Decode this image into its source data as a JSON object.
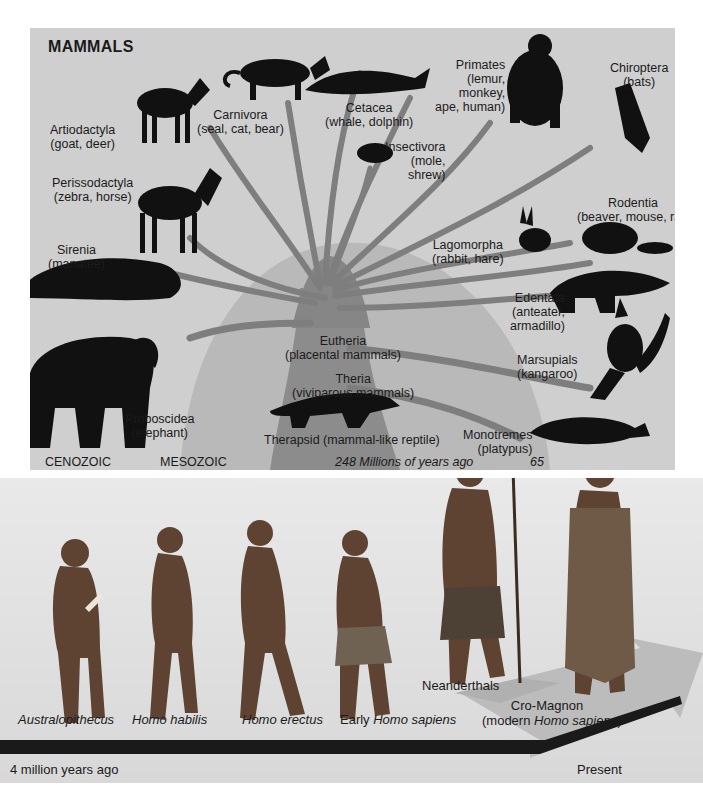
{
  "mammals": {
    "title": "MAMMALS",
    "groups": [
      {
        "name": "Artiodactyla",
        "examples": "(goat, deer)"
      },
      {
        "name": "Carnivora",
        "examples": "(seal, cat, bear)"
      },
      {
        "name": "Cetacea",
        "examples": "(whale, dolphin)"
      },
      {
        "name": "Primates",
        "examples": [
          "(lemur,",
          "monkey,",
          "ape, human)"
        ]
      },
      {
        "name": "Chiroptera",
        "examples": "(bats)"
      },
      {
        "name": "Insectivora",
        "examples": [
          "(mole,",
          "shrew)"
        ]
      },
      {
        "name": "Perissodactyla",
        "examples": "(zebra, horse)"
      },
      {
        "name": "Rodentia",
        "examples": "(beaver, mouse, rat)"
      },
      {
        "name": "Lagomorpha",
        "examples": "(rabbit, hare)"
      },
      {
        "name": "Sirenia",
        "examples": "(manatee)"
      },
      {
        "name": "Edentata",
        "examples": [
          "(anteater,",
          "armadillo)"
        ]
      },
      {
        "name": "Eutheria",
        "examples": "(placental mammals)"
      },
      {
        "name": "Marsupials",
        "examples": "(kangaroo)"
      },
      {
        "name": "Theria",
        "examples": "(viviparous mammals)"
      },
      {
        "name": "Proboscidea",
        "examples": "(elephant)"
      },
      {
        "name": "Monotremes",
        "examples": "(platypus)"
      },
      {
        "name": "Therapsid",
        "examples": "(mammal-like reptile)"
      }
    ],
    "eras": {
      "cenozoic": "CENOZOIC",
      "mesozoic": "MESOZOIC",
      "time_248": "248",
      "time_caption": "Millions of years ago",
      "time_65": "65"
    }
  },
  "human_evolution": {
    "species": [
      {
        "prefix": "",
        "name": "Australopithecus"
      },
      {
        "prefix": "",
        "name": "Homo habilis"
      },
      {
        "prefix": "",
        "name": "Homo erectus"
      },
      {
        "prefix": "Early ",
        "name": "Homo sapiens"
      },
      {
        "prefix": "",
        "name": "Neanderthals"
      },
      {
        "prefix": "Cro-Magnon",
        "name": "Homo sapiens",
        "paren_prefix": "(modern ",
        "paren_suffix": ")"
      }
    ],
    "timeline": {
      "start": "4 million years ago",
      "end": "Present"
    }
  },
  "colors": {
    "panel_bg": "#cfcfcf",
    "trunk": "#8a8a8a",
    "branch": "#7c7c7c",
    "silhouette": "#111111",
    "skin": "#6b4a36",
    "arrow": "#1a1a1a"
  }
}
